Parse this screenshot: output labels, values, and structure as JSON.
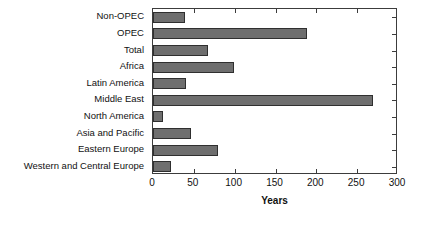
{
  "chart_data": {
    "type": "bar",
    "orientation": "horizontal",
    "title": "",
    "xlabel": "Years",
    "ylabel": "",
    "xlim": [
      0,
      300
    ],
    "xticks": [
      0,
      50,
      100,
      150,
      200,
      250,
      300
    ],
    "grid": false,
    "legend": null,
    "bar_color": "#6e6e6e",
    "bar_edge_color": "#2f2f2f",
    "categories": [
      "Non-OPEC",
      "OPEC",
      "Total",
      "Africa",
      "Latin America",
      "Middle East",
      "North America",
      "Asia and Pacific",
      "Eastern Europe",
      "Western and Central Europe"
    ],
    "values": [
      39,
      189,
      67,
      99,
      40,
      269,
      12,
      47,
      80,
      22
    ]
  }
}
